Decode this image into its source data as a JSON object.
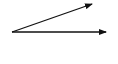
{
  "diagram": {
    "type": "vectors",
    "origin": [
      12,
      32
    ],
    "stroke_color": "#111111",
    "arrows": [
      {
        "name": "angled-arrow",
        "from": [
          12,
          32
        ],
        "to": [
          92,
          3
        ]
      },
      {
        "name": "horizontal-arrow",
        "from": [
          12,
          32
        ],
        "to": [
          107,
          32
        ]
      }
    ]
  }
}
